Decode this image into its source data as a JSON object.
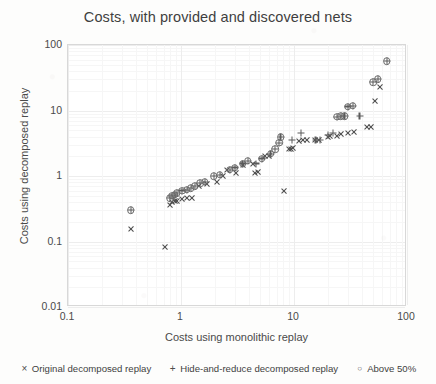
{
  "chart_data": {
    "type": "scatter",
    "title": "Costs, with provided and discovered nets",
    "xlabel": "Costs using monolithic replay",
    "ylabel": "Costs using decomposed replay",
    "xscale": "log",
    "yscale": "log",
    "xlim": [
      0.1,
      100
    ],
    "ylim": [
      0.01,
      100
    ],
    "xticks": [
      "0.1",
      "1",
      "10",
      "100"
    ],
    "yticks": [
      "100",
      "10",
      "1",
      "0.1",
      "0.01"
    ],
    "grid": true,
    "legend_position": "bottom",
    "legend": [
      {
        "glyph": "×",
        "label": "Original decomposed replay"
      },
      {
        "glyph": "+",
        "label": "Hide-and-reduce decomposed replay"
      },
      {
        "glyph": "○",
        "label": "Above 50%"
      }
    ],
    "series": [
      {
        "name": "Original decomposed replay",
        "marker": "x",
        "points": [
          [
            0.36,
            0.155
          ],
          [
            0.72,
            0.082
          ],
          [
            0.8,
            0.36
          ],
          [
            0.84,
            0.4
          ],
          [
            0.88,
            0.42
          ],
          [
            0.92,
            0.42
          ],
          [
            1.02,
            0.44
          ],
          [
            1.12,
            0.46
          ],
          [
            1.25,
            0.47
          ],
          [
            1.45,
            0.7
          ],
          [
            1.7,
            0.75
          ],
          [
            2.1,
            0.8
          ],
          [
            2.35,
            1.0
          ],
          [
            2.55,
            1.25
          ],
          [
            3.1,
            1.1
          ],
          [
            3.55,
            1.45
          ],
          [
            4.3,
            1.55
          ],
          [
            4.55,
            1.1
          ],
          [
            4.8,
            1.15
          ],
          [
            5.6,
            2.0
          ],
          [
            6.0,
            2.05
          ],
          [
            8.2,
            0.6
          ],
          [
            9.0,
            2.55
          ],
          [
            9.4,
            2.6
          ],
          [
            9.9,
            2.7
          ],
          [
            11.0,
            3.4
          ],
          [
            12.0,
            3.5
          ],
          [
            13.0,
            3.55
          ],
          [
            15.5,
            3.5
          ],
          [
            16.5,
            3.6
          ],
          [
            20.0,
            4.0
          ],
          [
            21.0,
            4.05
          ],
          [
            24.0,
            4.1
          ],
          [
            26.0,
            4.4
          ],
          [
            30.0,
            4.6
          ],
          [
            34.0,
            4.7
          ],
          [
            44.0,
            5.6
          ],
          [
            48.0,
            5.7
          ],
          [
            52.0,
            14.0
          ],
          [
            58.0,
            23.0
          ]
        ]
      },
      {
        "name": "Hide-and-reduce decomposed replay",
        "marker": "plus",
        "points": [
          [
            0.36,
            0.3
          ],
          [
            0.8,
            0.46
          ],
          [
            0.84,
            0.5
          ],
          [
            0.88,
            0.52
          ],
          [
            0.92,
            0.55
          ],
          [
            1.02,
            0.6
          ],
          [
            1.12,
            0.62
          ],
          [
            1.22,
            0.65
          ],
          [
            1.32,
            0.7
          ],
          [
            1.48,
            0.78
          ],
          [
            1.62,
            0.82
          ],
          [
            1.95,
            1.0
          ],
          [
            2.2,
            1.05
          ],
          [
            2.7,
            1.25
          ],
          [
            3.0,
            1.35
          ],
          [
            3.5,
            1.55
          ],
          [
            3.9,
            1.7
          ],
          [
            4.6,
            1.55
          ],
          [
            5.2,
            1.85
          ],
          [
            6.2,
            2.2
          ],
          [
            6.8,
            2.55
          ],
          [
            7.4,
            3.2
          ],
          [
            7.6,
            3.9
          ],
          [
            9.6,
            3.6
          ],
          [
            11.5,
            4.6
          ],
          [
            15.5,
            3.5
          ],
          [
            17.0,
            3.6
          ],
          [
            20.0,
            4.2
          ],
          [
            22.0,
            4.6
          ],
          [
            24.0,
            8.0
          ],
          [
            26.0,
            8.2
          ],
          [
            28.0,
            8.2
          ],
          [
            30.0,
            11.5
          ],
          [
            33.0,
            11.8
          ],
          [
            38.0,
            8.3
          ],
          [
            50.0,
            27.0
          ],
          [
            55.0,
            30.0
          ],
          [
            66.0,
            57.0
          ]
        ]
      },
      {
        "name": "Above 50%",
        "marker": "circle",
        "points": [
          [
            0.36,
            0.3
          ],
          [
            0.8,
            0.46
          ],
          [
            0.84,
            0.5
          ],
          [
            0.88,
            0.52
          ],
          [
            0.92,
            0.55
          ],
          [
            1.02,
            0.6
          ],
          [
            1.12,
            0.62
          ],
          [
            1.22,
            0.65
          ],
          [
            1.32,
            0.7
          ],
          [
            1.48,
            0.78
          ],
          [
            1.62,
            0.82
          ],
          [
            1.95,
            1.0
          ],
          [
            2.2,
            1.05
          ],
          [
            2.7,
            1.25
          ],
          [
            3.0,
            1.35
          ],
          [
            3.5,
            1.55
          ],
          [
            3.9,
            1.7
          ],
          [
            5.2,
            1.85
          ],
          [
            6.2,
            2.2
          ],
          [
            6.8,
            2.55
          ],
          [
            7.4,
            3.2
          ],
          [
            7.6,
            3.9
          ],
          [
            24.0,
            8.0
          ],
          [
            26.0,
            8.2
          ],
          [
            28.0,
            8.2
          ],
          [
            30.0,
            11.5
          ],
          [
            33.0,
            11.8
          ],
          [
            50.0,
            27.0
          ],
          [
            55.0,
            30.0
          ],
          [
            66.0,
            57.0
          ]
        ]
      }
    ]
  }
}
